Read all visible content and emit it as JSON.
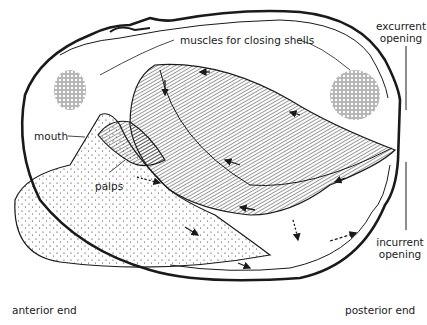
{
  "diagram": {
    "colors": {
      "ink": "#1a1a1a",
      "background": "#ffffff"
    },
    "labels": {
      "muscles": "muscles for closing shells",
      "excurrent_line1": "excurrent",
      "excurrent_line2": "opening",
      "mouth": "mouth",
      "palps": "palps",
      "incurrent_line1": "incurrent",
      "incurrent_line2": "opening",
      "anterior": "anterior end",
      "posterior": "posterior end"
    },
    "parts": [
      "shell",
      "anterior adductor muscle",
      "posterior adductor muscle",
      "gills",
      "palps",
      "mouth",
      "foot",
      "excurrent siphon",
      "incurrent siphon"
    ],
    "flow_arrows": "arrows indicate direction of water/food flow"
  }
}
